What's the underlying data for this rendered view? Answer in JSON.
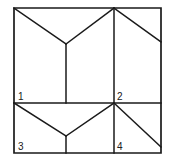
{
  "figure": {
    "shape": "square",
    "stroke_color": "#1a1a1a",
    "background_color": "#ffffff",
    "label_color": "#202020",
    "bounds": {
      "left": 14,
      "top": 8,
      "right": 161,
      "bottom": 153
    },
    "region_labels": [
      {
        "id": "1",
        "text": "1",
        "x": 18,
        "y": 100
      },
      {
        "id": "2",
        "text": "2",
        "x": 117,
        "y": 100
      },
      {
        "id": "3",
        "text": "3",
        "x": 18,
        "y": 150
      },
      {
        "id": "4",
        "text": "4",
        "x": 117,
        "y": 150
      }
    ],
    "segments": [
      {
        "name": "outer-square-border",
        "d": "M14,8 L161,8 L161,153 L14,153 Z"
      },
      {
        "name": "upper-left-diagonal",
        "d": "M14,8 L66,44"
      },
      {
        "name": "upper-right-diagonal",
        "d": "M66,44 L114,8"
      },
      {
        "name": "upper-center-vertical",
        "d": "M66,44 L66,103"
      },
      {
        "name": "full-height-vertical",
        "d": "M114,8 L114,153"
      },
      {
        "name": "upper-far-right-diagonal",
        "d": "M114,8 L161,42"
      },
      {
        "name": "middle-horizontal-divider",
        "d": "M14,103 L161,103"
      },
      {
        "name": "lower-left-diagonal",
        "d": "M14,103 L66,136"
      },
      {
        "name": "lower-right-diagonal",
        "d": "M66,136 L114,103"
      },
      {
        "name": "lower-center-vertical-stub",
        "d": "M66,136 L66,153"
      },
      {
        "name": "lower-far-right-diagonal",
        "d": "M114,103 L161,147"
      }
    ]
  }
}
